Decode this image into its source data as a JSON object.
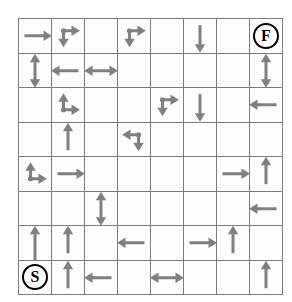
{
  "figure": {
    "name": "grid-maze-diagram",
    "type": "maze-grid",
    "rows": 8,
    "cols": 8,
    "colors": {
      "arrow": "#808080",
      "grid_line": "#7d7d7d",
      "marker_outline": "#000000",
      "cell_background": "#fdfdfd",
      "page_background": "#ffffff"
    },
    "start_label": "S",
    "finish_label": "F",
    "start_cell": {
      "row": 8,
      "col": 1
    },
    "finish_cell": {
      "row": 1,
      "col": 8
    }
  },
  "legend": {
    "arrow_icon": "arrow-icon",
    "start_icon": "start-marker-icon",
    "finish_icon": "finish-marker-icon",
    "junction_icon": "junction-dot-icon"
  },
  "cells": [
    {
      "row": 1,
      "col": 1,
      "kind": "arrow",
      "dirs": [
        "right"
      ]
    },
    {
      "row": 1,
      "col": 2,
      "kind": "junction",
      "dot": "top-left",
      "dirs": [
        "right",
        "down"
      ]
    },
    {
      "row": 1,
      "col": 3,
      "kind": "empty",
      "dirs": []
    },
    {
      "row": 1,
      "col": 4,
      "kind": "junction",
      "dot": "top-left",
      "dirs": [
        "right",
        "down"
      ]
    },
    {
      "row": 1,
      "col": 5,
      "kind": "empty",
      "dirs": []
    },
    {
      "row": 1,
      "col": 6,
      "kind": "arrow",
      "dirs": [
        "down"
      ]
    },
    {
      "row": 1,
      "col": 7,
      "kind": "empty",
      "dirs": []
    },
    {
      "row": 1,
      "col": 8,
      "kind": "finish",
      "label": "F",
      "dirs": []
    },
    {
      "row": 2,
      "col": 1,
      "kind": "arrow",
      "dirs": [
        "up",
        "down"
      ]
    },
    {
      "row": 2,
      "col": 2,
      "kind": "arrow",
      "dirs": [
        "left"
      ]
    },
    {
      "row": 2,
      "col": 3,
      "kind": "arrow",
      "dirs": [
        "left",
        "right"
      ]
    },
    {
      "row": 2,
      "col": 4,
      "kind": "empty",
      "dirs": []
    },
    {
      "row": 2,
      "col": 5,
      "kind": "empty",
      "dirs": []
    },
    {
      "row": 2,
      "col": 6,
      "kind": "empty",
      "dirs": []
    },
    {
      "row": 2,
      "col": 7,
      "kind": "empty",
      "dirs": []
    },
    {
      "row": 2,
      "col": 8,
      "kind": "arrow",
      "dirs": [
        "up",
        "down"
      ]
    },
    {
      "row": 3,
      "col": 1,
      "kind": "empty",
      "dirs": []
    },
    {
      "row": 3,
      "col": 2,
      "kind": "junction",
      "dot": "bottom-left",
      "dirs": [
        "up",
        "right"
      ]
    },
    {
      "row": 3,
      "col": 3,
      "kind": "empty",
      "dirs": []
    },
    {
      "row": 3,
      "col": 4,
      "kind": "empty",
      "dirs": []
    },
    {
      "row": 3,
      "col": 5,
      "kind": "junction",
      "dot": "top-left",
      "dirs": [
        "right",
        "down"
      ]
    },
    {
      "row": 3,
      "col": 6,
      "kind": "arrow",
      "dirs": [
        "down"
      ]
    },
    {
      "row": 3,
      "col": 7,
      "kind": "empty",
      "dirs": []
    },
    {
      "row": 3,
      "col": 8,
      "kind": "arrow",
      "dirs": [
        "left"
      ]
    },
    {
      "row": 4,
      "col": 1,
      "kind": "empty",
      "dirs": []
    },
    {
      "row": 4,
      "col": 2,
      "kind": "arrow",
      "dirs": [
        "up"
      ]
    },
    {
      "row": 4,
      "col": 3,
      "kind": "empty",
      "dirs": []
    },
    {
      "row": 4,
      "col": 4,
      "kind": "junction",
      "dot": "top-right",
      "dirs": [
        "left",
        "down"
      ]
    },
    {
      "row": 4,
      "col": 5,
      "kind": "empty",
      "dirs": []
    },
    {
      "row": 4,
      "col": 6,
      "kind": "empty",
      "dirs": []
    },
    {
      "row": 4,
      "col": 7,
      "kind": "empty",
      "dirs": []
    },
    {
      "row": 4,
      "col": 8,
      "kind": "empty",
      "dirs": []
    },
    {
      "row": 5,
      "col": 1,
      "kind": "junction",
      "dot": "bottom-left",
      "dirs": [
        "up",
        "right"
      ]
    },
    {
      "row": 5,
      "col": 2,
      "kind": "arrow",
      "dirs": [
        "right"
      ]
    },
    {
      "row": 5,
      "col": 3,
      "kind": "empty",
      "dirs": []
    },
    {
      "row": 5,
      "col": 4,
      "kind": "empty",
      "dirs": []
    },
    {
      "row": 5,
      "col": 5,
      "kind": "empty",
      "dirs": []
    },
    {
      "row": 5,
      "col": 6,
      "kind": "empty",
      "dirs": []
    },
    {
      "row": 5,
      "col": 7,
      "kind": "arrow",
      "dirs": [
        "right"
      ]
    },
    {
      "row": 5,
      "col": 8,
      "kind": "arrow",
      "dirs": [
        "up"
      ]
    },
    {
      "row": 6,
      "col": 1,
      "kind": "empty",
      "dirs": []
    },
    {
      "row": 6,
      "col": 2,
      "kind": "empty",
      "dirs": []
    },
    {
      "row": 6,
      "col": 3,
      "kind": "arrow",
      "dirs": [
        "up",
        "down"
      ]
    },
    {
      "row": 6,
      "col": 4,
      "kind": "empty",
      "dirs": []
    },
    {
      "row": 6,
      "col": 5,
      "kind": "empty",
      "dirs": []
    },
    {
      "row": 6,
      "col": 6,
      "kind": "empty",
      "dirs": []
    },
    {
      "row": 6,
      "col": 7,
      "kind": "empty",
      "dirs": []
    },
    {
      "row": 6,
      "col": 8,
      "kind": "arrow",
      "dirs": [
        "left"
      ]
    },
    {
      "row": 7,
      "col": 1,
      "kind": "arrow",
      "dirs": [
        "up"
      ],
      "long": true
    },
    {
      "row": 7,
      "col": 2,
      "kind": "arrow",
      "dirs": [
        "up"
      ]
    },
    {
      "row": 7,
      "col": 3,
      "kind": "empty",
      "dirs": []
    },
    {
      "row": 7,
      "col": 4,
      "kind": "arrow",
      "dirs": [
        "left"
      ]
    },
    {
      "row": 7,
      "col": 5,
      "kind": "empty",
      "dirs": []
    },
    {
      "row": 7,
      "col": 6,
      "kind": "arrow",
      "dirs": [
        "right"
      ]
    },
    {
      "row": 7,
      "col": 7,
      "kind": "arrow",
      "dirs": [
        "up"
      ]
    },
    {
      "row": 7,
      "col": 8,
      "kind": "empty",
      "dirs": []
    },
    {
      "row": 8,
      "col": 1,
      "kind": "start",
      "label": "S",
      "dirs": []
    },
    {
      "row": 8,
      "col": 2,
      "kind": "arrow",
      "dirs": [
        "up"
      ]
    },
    {
      "row": 8,
      "col": 3,
      "kind": "arrow",
      "dirs": [
        "left"
      ]
    },
    {
      "row": 8,
      "col": 4,
      "kind": "empty",
      "dirs": []
    },
    {
      "row": 8,
      "col": 5,
      "kind": "arrow",
      "dirs": [
        "left",
        "right"
      ]
    },
    {
      "row": 8,
      "col": 6,
      "kind": "empty",
      "dirs": []
    },
    {
      "row": 8,
      "col": 7,
      "kind": "empty",
      "dirs": []
    },
    {
      "row": 8,
      "col": 8,
      "kind": "arrow",
      "dirs": [
        "up"
      ]
    }
  ]
}
